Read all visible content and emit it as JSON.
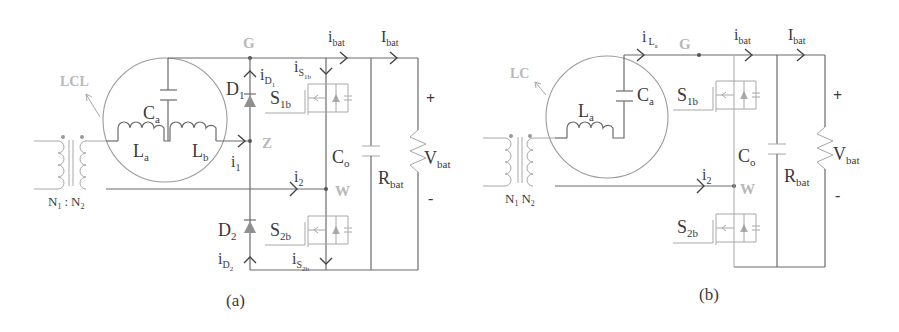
{
  "figure": {
    "panels": [
      {
        "id": "a",
        "caption": "(a)",
        "filter_label": "LCL",
        "nodes": {
          "G": "G",
          "Z": "Z",
          "W": "W"
        },
        "transformer": {
          "n1": "N",
          "n1_sub": "1",
          "sep": ":",
          "n2": "N",
          "n2_sub": "2"
        },
        "components": {
          "Ca": {
            "main": "C",
            "sub": "a"
          },
          "La": {
            "main": "L",
            "sub": "a"
          },
          "Lb": {
            "main": "L",
            "sub": "b"
          },
          "D1": {
            "main": "D",
            "sub": "1"
          },
          "D2": {
            "main": "D",
            "sub": "2"
          },
          "S1b": {
            "main": "S",
            "sub": "1b"
          },
          "S2b": {
            "main": "S",
            "sub": "2b"
          },
          "Co": {
            "main": "C",
            "sub": "o"
          },
          "Rbat": {
            "main": "R",
            "sub": "bat"
          },
          "Vbat": {
            "main": "V",
            "sub": "bat"
          }
        },
        "currents": {
          "ibat": {
            "main": "i",
            "sub": "bat"
          },
          "Ibat": {
            "main": "I",
            "sub": "bat"
          },
          "iD1": {
            "main": "i",
            "sub": "D",
            "subsub": "1"
          },
          "iS1b": {
            "main": "i",
            "sub": "S",
            "subsub": "1b"
          },
          "i1": {
            "main": "i",
            "sub": "1"
          },
          "i2": {
            "main": "i",
            "sub": "2"
          },
          "iD2": {
            "main": "i",
            "sub": "D",
            "subsub": "2"
          },
          "iS2b": {
            "main": "i",
            "sub": "S",
            "subsub": "2b"
          }
        },
        "polarity": {
          "plus": "+",
          "minus": "-"
        }
      },
      {
        "id": "b",
        "caption": "(b)",
        "filter_label": "LC",
        "nodes": {
          "G": "G",
          "W": "W"
        },
        "transformer": {
          "n1": "N",
          "n1_sub": "1",
          "n2": "N",
          "n2_sub": "2"
        },
        "components": {
          "La": {
            "main": "L",
            "sub": "a"
          },
          "Ca": {
            "main": "C",
            "sub": "a"
          },
          "S1b": {
            "main": "S",
            "sub": "1b"
          },
          "S2b": {
            "main": "S",
            "sub": "2b"
          },
          "Co": {
            "main": "C",
            "sub": "o"
          },
          "Rbat": {
            "main": "R",
            "sub": "bat"
          },
          "Vbat": {
            "main": "V",
            "sub": "bat"
          }
        },
        "currents": {
          "iLa": {
            "main": "i",
            "sub": "L",
            "subsub": "a"
          },
          "ibat": {
            "main": "i",
            "sub": "bat"
          },
          "Ibat": {
            "main": "I",
            "sub": "bat"
          },
          "i2": {
            "main": "i",
            "sub": "2"
          }
        },
        "polarity": {
          "plus": "+",
          "minus": "-"
        }
      }
    ]
  }
}
